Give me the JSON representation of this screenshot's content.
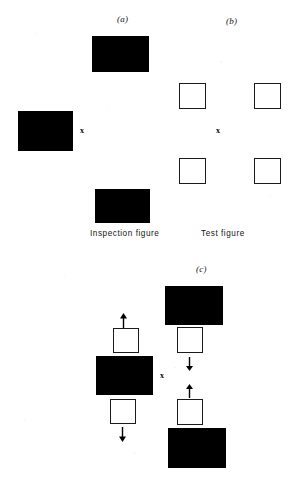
{
  "figure": {
    "panels": [
      {
        "id": "a",
        "label": "(a)",
        "caption": "Inspection figure",
        "description": "Two solid black rectangles above and below a fixation point, plus one black rectangle at left"
      },
      {
        "id": "b",
        "label": "(b)",
        "caption": "Test figure",
        "description": "Four open white squares arranged around a fixation point"
      },
      {
        "id": "c",
        "label": "(c)",
        "description": "Two columns showing open squares with motion arrows adjacent to solid black rectangles"
      }
    ],
    "fixation_marks": [
      {
        "panel": "a",
        "symbol": "x"
      },
      {
        "panel": "b",
        "symbol": "x"
      },
      {
        "panel": "c",
        "symbol": "x"
      }
    ],
    "colors": {
      "solid_figure": "#000000",
      "open_figure_fill": "#ffffff",
      "open_figure_stroke": "#1b1b1b",
      "page_background": "#ffffff",
      "text": "#141414"
    },
    "arrows": {
      "glyph_up": "arrow-up",
      "glyph_down": "arrow-down",
      "count": 4,
      "directions": [
        "up",
        "down",
        "down",
        "up"
      ]
    },
    "shape_counts": {
      "black_rectangles": 6,
      "open_squares": 8
    }
  }
}
